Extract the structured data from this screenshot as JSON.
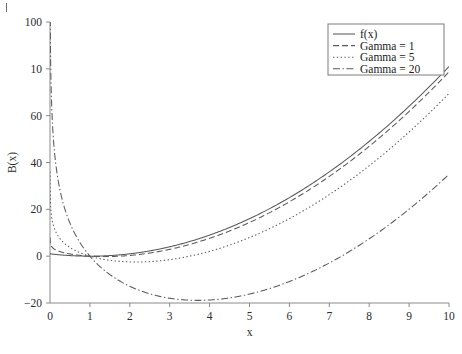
{
  "figure": {
    "background": "#ffffff",
    "ink_color": "#5a5a5a",
    "axis_color": "#8a8a8a",
    "stray_scan_mark": "|"
  },
  "chart_data": {
    "type": "line",
    "title": "",
    "xlabel": "x",
    "ylabel": "B(x)",
    "xlim": [
      0,
      10
    ],
    "ylim": [
      -20,
      100
    ],
    "xticks": [
      0,
      1,
      2,
      3,
      4,
      5,
      6,
      7,
      8,
      9,
      10
    ],
    "xticklabels": [
      "0",
      "1",
      "2",
      "3",
      "4",
      "5",
      "6",
      "7",
      "8",
      "9",
      "10"
    ],
    "yticks": [
      -20,
      0,
      20,
      40,
      60,
      80,
      100
    ],
    "yticklabels": [
      "-20",
      "0",
      "20",
      "40",
      "60",
      "10",
      "100"
    ],
    "ytick_label_note": "The label drawn at the y=80 position reads '10' in the scanned original (print/scan artifact); reproduced as shown.",
    "grid": false,
    "frame": "left-and-bottom-only",
    "legend_position": "top-right",
    "base_function": {
      "expression": "f(x) = x^2 - 2x + 1",
      "quadratic_coefficients": {
        "a": 1,
        "b": -2,
        "c": 1
      }
    },
    "barrier_expression": "B(x) = f(x) - Gamma*ln(x)",
    "series": [
      {
        "name": "f(x)",
        "gamma": 0,
        "linestyle": "solid",
        "dasharray": "",
        "x": [
          0.05,
          0.25,
          0.5,
          1,
          1.5,
          2,
          3,
          4,
          5,
          6,
          7,
          8,
          9,
          10
        ],
        "values": [
          0.9,
          0.56,
          0.25,
          0,
          0.25,
          1,
          4,
          9,
          16,
          25,
          36,
          49,
          64,
          81
        ]
      },
      {
        "name": "Gamma = 1",
        "gamma": 1,
        "linestyle": "dashed",
        "dasharray": "6,3",
        "x": [
          0.05,
          0.25,
          0.5,
          1,
          1.5,
          2,
          3,
          4,
          5,
          6,
          7,
          8,
          9,
          10
        ],
        "values": [
          3.9,
          1.95,
          0.94,
          0,
          -0.16,
          0.31,
          2.9,
          7.61,
          14.39,
          23.21,
          34.05,
          46.92,
          61.8,
          78.7
        ]
      },
      {
        "name": "Gamma = 5",
        "gamma": 5,
        "linestyle": "dotted",
        "dasharray": "1.4,2.4",
        "x": [
          0.05,
          0.25,
          0.5,
          1,
          1.5,
          2,
          3,
          4,
          5,
          6,
          7,
          8,
          9,
          10
        ],
        "values": [
          15.88,
          7.49,
          3.72,
          0,
          -1.78,
          -2.47,
          -1.49,
          2.07,
          7.95,
          16.04,
          26.27,
          38.6,
          53.01,
          69.49
        ]
      },
      {
        "name": "Gamma = 20",
        "gamma": 20,
        "linestyle": "dashdot",
        "dasharray": "7,2.5,1.4,2.5",
        "x": [
          0.05,
          0.25,
          0.5,
          1,
          1.5,
          2,
          3,
          4,
          5,
          6,
          7,
          8,
          9,
          10
        ],
        "values": [
          60.8,
          28.29,
          14.11,
          0,
          -7.86,
          -12.86,
          -17.97,
          -18.73,
          -16.19,
          -10.83,
          -2.92,
          7.41,
          20.05,
          34.95
        ]
      }
    ],
    "legend_entries": [
      "f(x)",
      "Gamma = 1",
      "Gamma = 5",
      "Gamma = 20"
    ]
  }
}
